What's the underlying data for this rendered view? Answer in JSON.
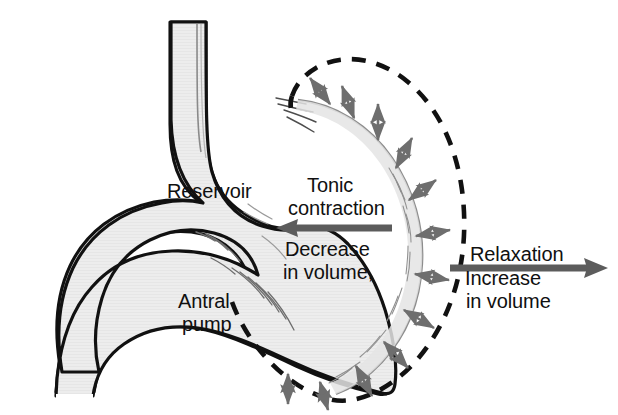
{
  "figure": {
    "colors": {
      "organ_fill": "#e9e9e9",
      "organ_outline": "#111111",
      "inner_line": "#808080",
      "arrow_gray": "#6e6e6e",
      "dashed_black": "#111111",
      "background": "#ffffff",
      "text": "#101010"
    }
  },
  "labels": {
    "reservoir": "Reservoir",
    "tonic_line1": "Tonic",
    "tonic_line2": "contraction",
    "decrease_line1": "Decrease",
    "decrease_line2": "in volume,",
    "relaxation": "Relaxation",
    "increase_line1": "Increase",
    "increase_line2": "in volume",
    "antral_line1": "Antral",
    "antral_line2": "pump"
  },
  "arrows": {
    "tonic_contraction_direction": "left",
    "relaxation_direction": "right",
    "radial_count": 11,
    "radial_style": "double-headed"
  },
  "boundaries": {
    "contracted": "solid gray inner wall",
    "relaxed": "black dashed outer outline"
  }
}
